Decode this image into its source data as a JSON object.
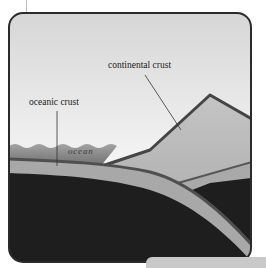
{
  "diagram": {
    "labels": {
      "continental_crust": "continental crust",
      "oceanic_crust": "oceanic crust",
      "ocean": "ocean"
    },
    "colors": {
      "sky_top": "#d9d9d9",
      "sky_bottom": "#f6f6f6",
      "frame": "#2b2b2b",
      "continental_crust": "#bdbdbd",
      "continental_edge": "#4a4a4a",
      "ocean_top": "#9a9a9a",
      "ocean_bottom": "#6a6a6a",
      "oceanic_crust": "#a8a8a8",
      "oceanic_crust_edge": "#555555",
      "mantle": "#1e1e1e",
      "tab": "#c9c9c9"
    }
  }
}
